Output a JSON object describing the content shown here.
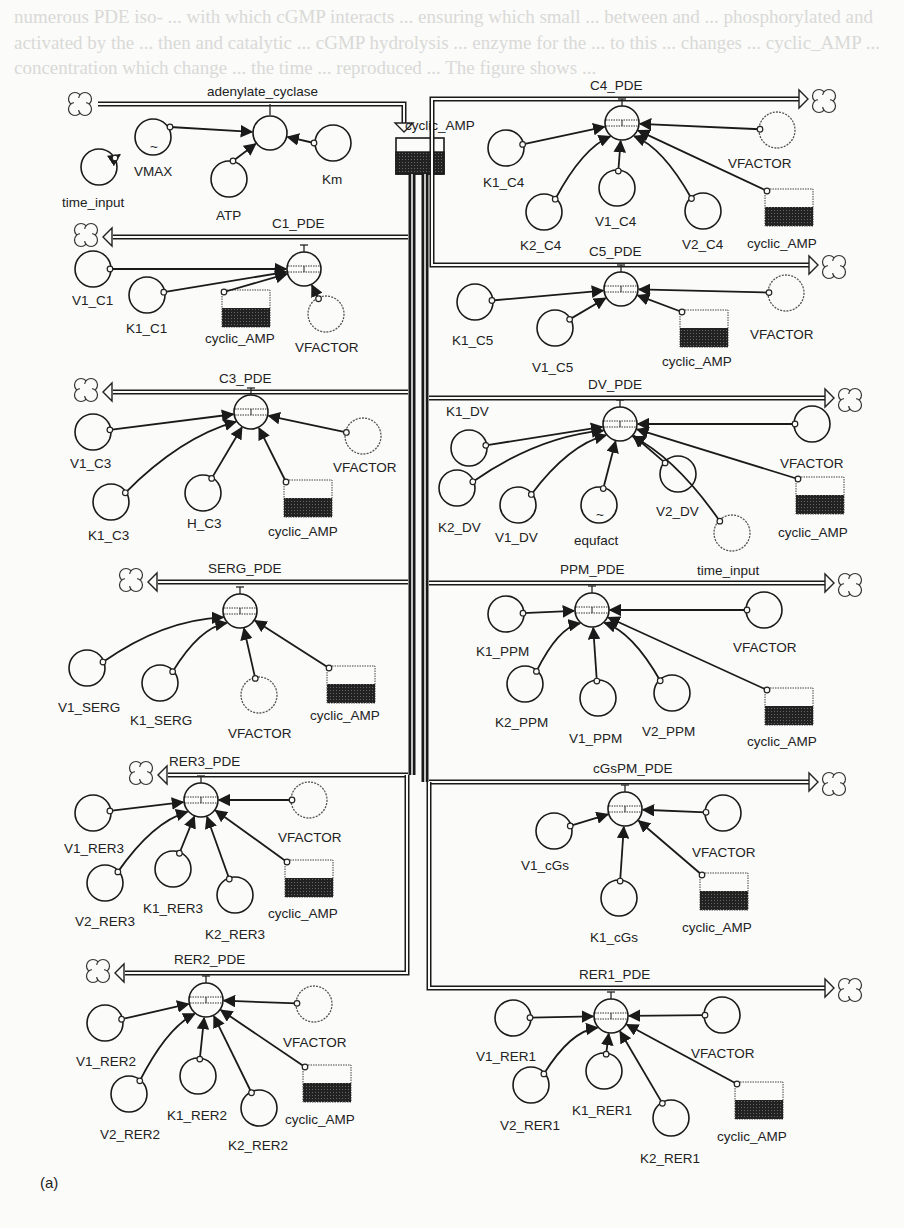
{
  "figure": {
    "label": "(a)",
    "type": "STELLA stock-flow diagram",
    "stock": {
      "name": "cyclic_AMP"
    },
    "inflow": {
      "name": "adenylate_cyclase",
      "converters": [
        {
          "name": "VMAX",
          "x": 153,
          "y": 137,
          "ghost": false,
          "graphical": true
        },
        {
          "name": "time_input",
          "x": 99,
          "y": 167,
          "ghost": false
        },
        {
          "name": "ATP",
          "x": 229,
          "y": 179,
          "ghost": false
        },
        {
          "name": "Km",
          "x": 333,
          "y": 143,
          "ghost": false
        }
      ],
      "flow_x": 270,
      "flow_y": 133
    },
    "outflows": [
      {
        "name": "C1_PDE",
        "side": "left",
        "pipe_y": 237,
        "fx": 304,
        "fy": 269,
        "converters": [
          {
            "name": "V1_C1",
            "x": 93,
            "y": 269,
            "lx": 72,
            "ly": 305
          },
          {
            "name": "K1_C1",
            "x": 147,
            "y": 295,
            "lx": 126,
            "ly": 333
          },
          {
            "name": "VFACTOR",
            "x": 326,
            "y": 314,
            "lx": 295,
            "ly": 352,
            "ghost": true
          }
        ],
        "stock_copy": {
          "x": 222,
          "y": 290,
          "lx": 205,
          "ly": 343
        }
      },
      {
        "name": "C3_PDE",
        "side": "left",
        "pipe_y": 392,
        "fx": 251,
        "fy": 412,
        "converters": [
          {
            "name": "V1_C3",
            "x": 93,
            "y": 432,
            "lx": 70,
            "ly": 468
          },
          {
            "name": "K1_C3",
            "x": 111,
            "y": 502,
            "lx": 88,
            "ly": 540
          },
          {
            "name": "H_C3",
            "x": 203,
            "y": 493,
            "lx": 187,
            "ly": 528
          },
          {
            "name": "VFACTOR",
            "x": 363,
            "y": 436,
            "lx": 333,
            "ly": 472,
            "ghost": true
          }
        ],
        "stock_copy": {
          "x": 284,
          "y": 480,
          "lx": 268,
          "ly": 536
        }
      },
      {
        "name": "SERG_PDE",
        "side": "left",
        "pipe_y": 582,
        "fx": 240,
        "fy": 611,
        "converters": [
          {
            "name": "V1_SERG",
            "x": 87,
            "y": 668,
            "lx": 58,
            "ly": 712
          },
          {
            "name": "K1_SERG",
            "x": 160,
            "y": 683,
            "lx": 130,
            "ly": 725
          },
          {
            "name": "VFACTOR",
            "x": 259,
            "y": 695,
            "lx": 228,
            "ly": 738,
            "ghost": true
          }
        ],
        "stock_copy": {
          "x": 327,
          "y": 666,
          "lx": 310,
          "ly": 720
        }
      },
      {
        "name": "RER3_PDE",
        "side": "left",
        "pipe_y": 775,
        "fx": 201,
        "fy": 800,
        "converters": [
          {
            "name": "V1_RER3",
            "x": 93,
            "y": 813,
            "lx": 64,
            "ly": 853
          },
          {
            "name": "V2_RER3",
            "x": 105,
            "y": 883,
            "lx": 75,
            "ly": 926
          },
          {
            "name": "K1_RER3",
            "x": 173,
            "y": 869,
            "lx": 143,
            "ly": 913
          },
          {
            "name": "K2_RER3",
            "x": 235,
            "y": 895,
            "lx": 205,
            "ly": 939
          },
          {
            "name": "VFACTOR",
            "x": 309,
            "y": 800,
            "lx": 278,
            "ly": 842,
            "ghost": true
          }
        ],
        "stock_copy": {
          "x": 285,
          "y": 860,
          "lx": 268,
          "ly": 918
        }
      },
      {
        "name": "RER2_PDE",
        "side": "left",
        "pipe_y": 973,
        "fx": 206,
        "fy": 1000,
        "converters": [
          {
            "name": "V1_RER2",
            "x": 105,
            "y": 1023,
            "lx": 76,
            "ly": 1066
          },
          {
            "name": "V2_RER2",
            "x": 129,
            "y": 1094,
            "lx": 100,
            "ly": 1139
          },
          {
            "name": "K1_RER2",
            "x": 198,
            "y": 1076,
            "lx": 167,
            "ly": 1120
          },
          {
            "name": "K2_RER2",
            "x": 259,
            "y": 1108,
            "lx": 228,
            "ly": 1150
          },
          {
            "name": "VFACTOR",
            "x": 314,
            "y": 1004,
            "lx": 283,
            "ly": 1047,
            "ghost": true
          }
        ],
        "stock_copy": {
          "x": 303,
          "y": 1065,
          "lx": 285,
          "ly": 1124
        }
      },
      {
        "name": "C4_PDE",
        "side": "right",
        "pipe_y": 99,
        "fx": 622,
        "fy": 123,
        "converters": [
          {
            "name": "K1_C4",
            "x": 506,
            "y": 148,
            "lx": 483,
            "ly": 187
          },
          {
            "name": "K2_C4",
            "x": 544,
            "y": 212,
            "lx": 520,
            "ly": 250
          },
          {
            "name": "V1_C4",
            "x": 617,
            "y": 188,
            "lx": 595,
            "ly": 226
          },
          {
            "name": "V2_C4",
            "x": 703,
            "y": 211,
            "lx": 682,
            "ly": 249
          },
          {
            "name": "VFACTOR",
            "x": 777,
            "y": 130,
            "lx": 728,
            "ly": 168,
            "ghost": true
          }
        ],
        "stock_copy": {
          "x": 765,
          "y": 189,
          "lx": 747,
          "ly": 248
        }
      },
      {
        "name": "C5_PDE",
        "side": "right",
        "pipe_y": 265,
        "fx": 621,
        "fy": 289,
        "converters": [
          {
            "name": "K1_C5",
            "x": 475,
            "y": 302,
            "lx": 452,
            "ly": 345
          },
          {
            "name": "V1_C5",
            "x": 555,
            "y": 328,
            "lx": 532,
            "ly": 372
          },
          {
            "name": "VFACTOR",
            "x": 786,
            "y": 293,
            "lx": 750,
            "ly": 339,
            "ghost": true
          }
        ],
        "stock_copy": {
          "x": 680,
          "y": 310,
          "lx": 662,
          "ly": 366
        }
      },
      {
        "name": "DV_PDE",
        "side": "right",
        "pipe_y": 398,
        "fx": 620,
        "fy": 424,
        "converters": [
          {
            "name": "K1_DV",
            "x": 469,
            "y": 448,
            "lx": 446,
            "ly": 416
          },
          {
            "name": "K2_DV",
            "x": 457,
            "y": 488,
            "lx": 438,
            "ly": 532
          },
          {
            "name": "V1_DV",
            "x": 518,
            "y": 505,
            "lx": 495,
            "ly": 542
          },
          {
            "name": "equfact",
            "x": 599,
            "y": 505,
            "lx": 574,
            "ly": 545,
            "graphical": true
          },
          {
            "name": "V2_DV",
            "x": 678,
            "y": 474,
            "lx": 656,
            "ly": 516
          },
          {
            "name": "VFACTOR",
            "x": 812,
            "y": 424,
            "lx": 780,
            "ly": 468
          },
          {
            "name": "",
            "x": 732,
            "y": 533,
            "ghost": true
          }
        ],
        "stock_copy": {
          "x": 796,
          "y": 477,
          "lx": 778,
          "ly": 537
        }
      },
      {
        "name": "PPM_PDE",
        "side": "right",
        "pipe_y": 583,
        "fx": 592,
        "fy": 610,
        "converters": [
          {
            "name": "K1_PPM",
            "x": 506,
            "y": 614,
            "lx": 476,
            "ly": 656
          },
          {
            "name": "K2_PPM",
            "x": 525,
            "y": 684,
            "lx": 495,
            "ly": 727
          },
          {
            "name": "V1_PPM",
            "x": 598,
            "y": 698,
            "lx": 569,
            "ly": 743
          },
          {
            "name": "V2_PPM",
            "x": 672,
            "y": 693,
            "lx": 642,
            "ly": 736
          },
          {
            "name": "VFACTOR",
            "x": 764,
            "y": 610,
            "lx": 733,
            "ly": 652
          }
        ],
        "stock_copy": {
          "x": 765,
          "y": 688,
          "lx": 747,
          "ly": 746
        },
        "extra_label": {
          "text": "time_input",
          "x": 697,
          "y": 583
        }
      },
      {
        "name": "cGsPM_PDE",
        "side": "right",
        "pipe_y": 782,
        "fx": 625,
        "fy": 809,
        "converters": [
          {
            "name": "V1_cGs",
            "x": 554,
            "y": 831,
            "lx": 521,
            "ly": 870
          },
          {
            "name": "K1_cGs",
            "x": 619,
            "y": 898,
            "lx": 590,
            "ly": 942
          },
          {
            "name": "VFACTOR",
            "x": 723,
            "y": 813,
            "lx": 692,
            "ly": 857
          }
        ],
        "stock_copy": {
          "x": 700,
          "y": 873,
          "lx": 682,
          "ly": 932
        }
      },
      {
        "name": "RER1_PDE",
        "side": "right",
        "pipe_y": 988,
        "fx": 611,
        "fy": 1016,
        "converters": [
          {
            "name": "V1_RER1",
            "x": 513,
            "y": 1018,
            "lx": 476,
            "ly": 1061
          },
          {
            "name": "V2_RER1",
            "x": 531,
            "y": 1085,
            "lx": 500,
            "ly": 1130
          },
          {
            "name": "K1_RER1",
            "x": 604,
            "y": 1071,
            "lx": 572,
            "ly": 1115
          },
          {
            "name": "K2_RER1",
            "x": 671,
            "y": 1118,
            "lx": 640,
            "ly": 1163
          },
          {
            "name": "VFACTOR",
            "x": 722,
            "y": 1015,
            "lx": 691,
            "ly": 1058
          }
        ],
        "stock_copy": {
          "x": 735,
          "y": 1082,
          "lx": 717,
          "ly": 1141
        }
      }
    ]
  },
  "ghost_text": "numerous PDE iso- ... with which cGMP interacts ... ensuring which small ... between and ... phosphorylated and activated by the ... then and catalytic ... cGMP hydrolysis ... enzyme for the ... to this ... changes ... cyclic_AMP ... concentration which change ... the time ... reproduced ... The figure shows ..."
}
